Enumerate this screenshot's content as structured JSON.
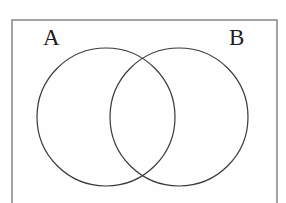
{
  "figure": {
    "kind": "venn-diagram",
    "background_color": "#fefefe",
    "universe": {
      "name": "universal-set-rectangle",
      "stroke_color": "#7d7d7d",
      "stroke_width": 1.4,
      "x": 12,
      "y": 20,
      "width": 265,
      "height": 190,
      "clipped_at_bottom": true
    },
    "circles": [
      {
        "name": "circle-a",
        "label": "A",
        "cx": 106,
        "cy": 117,
        "r": 69,
        "stroke_color": "#3a3a3a",
        "stroke_width": 1.2,
        "fill": "none"
      },
      {
        "name": "circle-b",
        "label": "B",
        "cx": 179,
        "cy": 117,
        "r": 69,
        "stroke_color": "#3a3a3a",
        "stroke_width": 1.2,
        "fill": "none"
      }
    ],
    "labels": {
      "a": "A",
      "b": "B"
    },
    "intersection": {
      "name": "intersection-lens",
      "upper_point_x": 143,
      "upper_point_y": 52,
      "lower_point_x": 142,
      "lower_point_y": 182
    }
  }
}
